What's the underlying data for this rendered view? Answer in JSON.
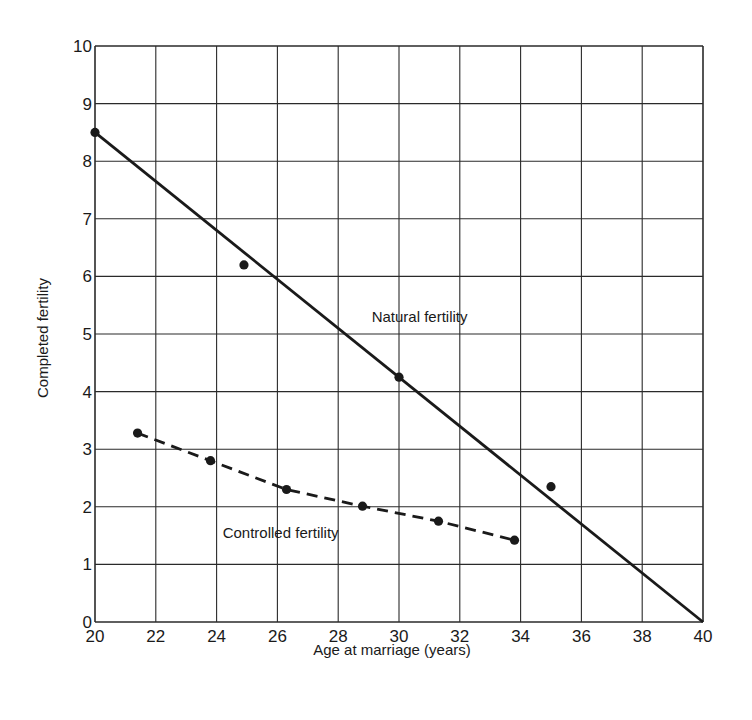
{
  "chart_data": {
    "type": "line",
    "title": "",
    "xlabel": "Age at marriage (years)",
    "ylabel": "Completed fertility",
    "xlim": [
      20,
      40
    ],
    "ylim": [
      0,
      10
    ],
    "xticks": [
      20,
      22,
      24,
      26,
      28,
      30,
      32,
      34,
      36,
      38,
      40
    ],
    "yticks": [
      0,
      1,
      2,
      3,
      4,
      5,
      6,
      7,
      8,
      9,
      10
    ],
    "grid": true,
    "legend": "none (inline annotations)",
    "series": [
      {
        "name": "Natural fertility",
        "style": "solid line (fitted) with observed points",
        "line": {
          "x": [
            20,
            40
          ],
          "y": [
            8.5,
            0
          ]
        },
        "points": {
          "x": [
            20,
            24.9,
            30.0,
            35.0
          ],
          "y": [
            8.5,
            6.2,
            4.25,
            2.35
          ]
        },
        "label_position": {
          "x": 29.1,
          "y": 5.2
        }
      },
      {
        "name": "Controlled fertility",
        "style": "dashed line through points",
        "points": {
          "x": [
            21.4,
            23.8,
            26.3,
            28.8,
            31.3,
            33.8
          ],
          "y": [
            3.28,
            2.8,
            2.3,
            2.01,
            1.75,
            1.42
          ]
        },
        "label_position": {
          "x": 24.2,
          "y": 1.45
        }
      }
    ]
  },
  "labels": {
    "x_axis": "Age at marriage (years)",
    "y_axis": "Completed fertility",
    "natural": "Natural fertility",
    "controlled": "Controlled fertility"
  },
  "colors": {
    "ink": "#1a1a1a",
    "grid": "#2a2a2a",
    "background": "#ffffff"
  }
}
